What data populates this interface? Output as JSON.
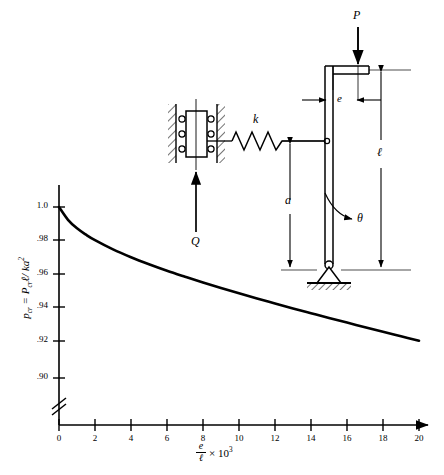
{
  "figure": {
    "name": "eccentrically-loaded-spring-supported-column",
    "axis_break_symbol": "//"
  },
  "chart_data": {
    "type": "line",
    "title": "",
    "xlabel": "e/ℓ × 10³",
    "ylabel": "p_cr = P_cr ℓ / ka²",
    "xlim": [
      0,
      20
    ],
    "ylim": [
      0.89,
      1.005
    ],
    "grid": false,
    "legend": null,
    "xticks": [
      0,
      2,
      4,
      6,
      8,
      10,
      12,
      14,
      16,
      18,
      20
    ],
    "xtick_labels": [
      "0",
      "2",
      "4",
      "6",
      "8",
      "10",
      "12",
      "14",
      "16",
      "18",
      "20"
    ],
    "yticks": [
      0.9,
      0.92,
      0.94,
      0.96,
      0.98,
      1.0
    ],
    "ytick_labels": [
      ".90",
      ".92",
      ".94",
      ".96",
      ".98",
      "1.0"
    ],
    "x": [
      0,
      0.5,
      1,
      1.5,
      2,
      3,
      4,
      5,
      6,
      7,
      8,
      9,
      10,
      11,
      12,
      13,
      14,
      15,
      16,
      17,
      18,
      19,
      20
    ],
    "values": [
      1.0,
      0.9925,
      0.9875,
      0.9838,
      0.9806,
      0.9752,
      0.9706,
      0.9665,
      0.9627,
      0.9592,
      0.9558,
      0.9526,
      0.9495,
      0.9465,
      0.9436,
      0.9407,
      0.9379,
      0.9351,
      0.9324,
      0.9297,
      0.927,
      0.9244,
      0.9218
    ],
    "series_name": "critical load ratio"
  },
  "axis_labels": {
    "y_text": "p",
    "y_sub1": "cr",
    "y_eq": " = P",
    "y_sub2": "cr",
    "y_tail": "ℓ/ ka",
    "y_sup": "2",
    "x_numer": "e",
    "x_denom": "ℓ",
    "x_mult": "× 10",
    "x_exp": "3"
  },
  "diagram": {
    "load_label": "P",
    "force_label": "Q",
    "spring_label": "k",
    "eccentricity_label": "e",
    "height_label": "a",
    "length_label": "ℓ",
    "angle_label": "θ",
    "support": "pin-support",
    "ground": "hatched-ground",
    "guide": "hatched-guide-rails",
    "block": "roller-block"
  }
}
